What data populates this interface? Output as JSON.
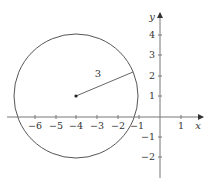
{
  "diagram": {
    "colors": {
      "axis": "#777777",
      "circle": "#555555",
      "text": "#333333",
      "background": "#ffffff"
    },
    "layout": {
      "origin_px": [
        160,
        117
      ],
      "unit_px": 20.6
    },
    "axes": {
      "x_label": "x",
      "y_label": "y",
      "x_ticks": [
        {
          "value": -6,
          "label": "−6"
        },
        {
          "value": -5,
          "label": "−5"
        },
        {
          "value": -4,
          "label": "−4"
        },
        {
          "value": -3,
          "label": "−3"
        },
        {
          "value": -2,
          "label": "−2"
        },
        {
          "value": -1,
          "label": "−1"
        },
        {
          "value": 1,
          "label": "1"
        }
      ],
      "y_ticks": [
        {
          "value": 4,
          "label": "4"
        },
        {
          "value": 3,
          "label": "3"
        },
        {
          "value": 2,
          "label": "2"
        },
        {
          "value": 1,
          "label": "1"
        },
        {
          "value": -1,
          "label": "−1"
        },
        {
          "value": -2,
          "label": "−2"
        }
      ],
      "x_range": [
        -7,
        2
      ],
      "y_range": [
        -3,
        5
      ]
    },
    "circle": {
      "center": [
        -4,
        1
      ],
      "radius": 3,
      "radius_label": "3",
      "radius_endpoint_angle_deg": 23
    }
  }
}
